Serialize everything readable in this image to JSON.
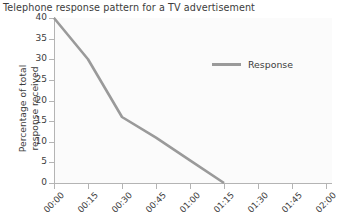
{
  "chart_data": {
    "type": "line",
    "title": "Telephone response pattern for a TV advertisement",
    "xlabel": "",
    "ylabel": "Percentage of total response received",
    "ylabel_lines": [
      "Percentage of total",
      "response received"
    ],
    "categories": [
      "00:00",
      "00:15",
      "00:30",
      "00:45",
      "01:00",
      "01:15",
      "01:30",
      "01:45",
      "02:00"
    ],
    "ytick_labels": [
      "0",
      "5",
      "10",
      "15",
      "20",
      "25",
      "30",
      "35",
      "40"
    ],
    "ylim": [
      0,
      40
    ],
    "ytick_step": 5,
    "grid": false,
    "legend_position": "inside-top-right",
    "series": [
      {
        "name": "Response",
        "color": "#9a9a9a",
        "x": [
          "00:00",
          "00:15",
          "00:30",
          "00:45",
          "01:00",
          "01:15"
        ],
        "values": [
          40,
          30,
          16,
          11,
          5.5,
          0
        ]
      }
    ]
  },
  "legend": {
    "entries": [
      {
        "label": "Response",
        "color": "#9a9a9a",
        "swatch": "line-swatch"
      }
    ]
  },
  "colors": {
    "series_line": "#9a9a9a",
    "axis": "#b4b4b4",
    "text": "#3c3c3c",
    "plot_background": "#fbfbfb",
    "page_background": "#ffffff"
  }
}
